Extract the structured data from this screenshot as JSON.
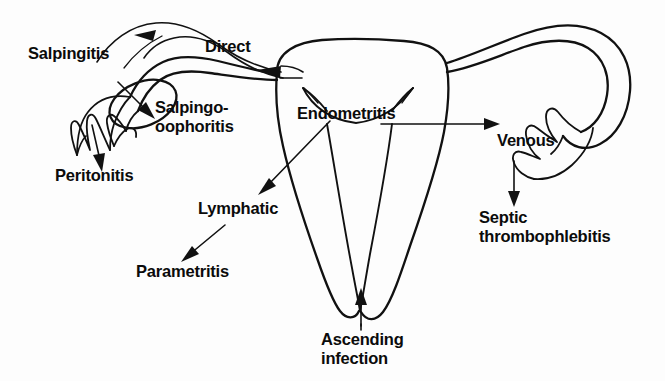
{
  "figure": {
    "kind": "medical-anatomy-flow-diagram",
    "background_color": "#fdfdfd",
    "ink_color": "#111111",
    "width": 665,
    "height": 381
  },
  "labels": {
    "salpingitis": "Salpingitis",
    "direct": "Direct",
    "salpingo_oophoritis_line1": "Salpingo-",
    "salpingo_oophoritis_line2": "oophoritis",
    "peritonitis": "Peritonitis",
    "endometritis": "Endometritis",
    "venous": "Venous",
    "septic_line1": "Septic",
    "septic_line2": "thrombophlebitis",
    "lymphatic": "Lymphatic",
    "parametritis": "Parametritis",
    "ascending_line1": "Ascending",
    "ascending_line2": "infection"
  },
  "routes": [
    {
      "name": "direct",
      "label": "Direct",
      "from": "uterine cornu / uterine cavity",
      "to": "left fallopian tube",
      "arrow": "curved-leftward",
      "outcomes": [
        "Salpingitis",
        "Salpingo-oophoritis",
        "Peritonitis"
      ]
    },
    {
      "name": "venous",
      "label": "Venous",
      "from": "endometrium",
      "to": "pelvic veins",
      "arrow": "straight-rightward",
      "outcomes": [
        "Septic thrombophlebitis"
      ]
    },
    {
      "name": "lymphatic",
      "label": "Lymphatic",
      "from": "endometrium / myometrium",
      "to": "parametrium",
      "arrow": "diagonal-down-left",
      "outcomes": [
        "Parametritis"
      ]
    },
    {
      "name": "ascending",
      "label": "Ascending infection",
      "from": "vagina / cervix",
      "to": "endometrial cavity",
      "arrow": "straight-upward",
      "outcomes": [
        "Endometritis"
      ]
    }
  ],
  "anatomy_parts": [
    "uterine body (fundus)",
    "endometrial cavity",
    "cervix and cervical canal",
    "left fallopian tube",
    "left ovary",
    "left fimbriae",
    "right fallopian tube",
    "right fimbriae"
  ]
}
